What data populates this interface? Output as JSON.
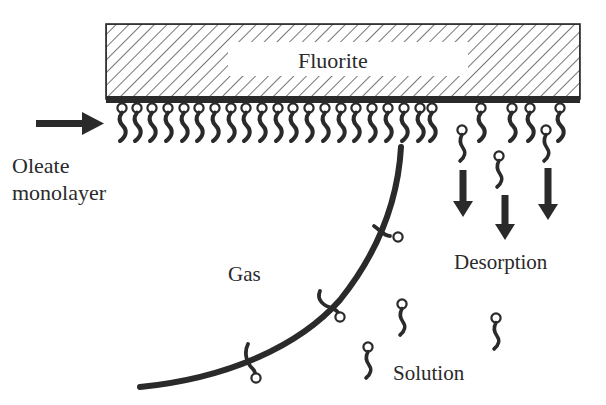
{
  "diagram": {
    "labels": {
      "substrate": "Fluorite",
      "monolayer_line1": "Oleate",
      "monolayer_line2": "monolayer",
      "gas": "Gas",
      "desorption": "Desorption",
      "solution": "Solution"
    },
    "colors": {
      "ink": "#2a2a2a",
      "background": "#ffffff"
    },
    "substrate_box": {
      "x": 106,
      "y": 24,
      "width": 474,
      "height": 73
    },
    "label_window": {
      "x": 228,
      "y": 42,
      "width": 240,
      "height": 34
    },
    "monolayer_heads_x": [
      122,
      137,
      152,
      168,
      184,
      199,
      215,
      231,
      246,
      262,
      278,
      293,
      309,
      325,
      341,
      356,
      372,
      388,
      404,
      420,
      432
    ],
    "sparse_adsorbed_heads_x": [
      481,
      512,
      530,
      560
    ],
    "desorbing_molecules": [
      {
        "x": 462,
        "y": 130
      },
      {
        "x": 499,
        "y": 156
      },
      {
        "x": 546,
        "y": 130
      }
    ],
    "desorption_arrows": [
      {
        "x": 463,
        "top": 170,
        "bottom": 217
      },
      {
        "x": 505,
        "top": 195,
        "bottom": 240
      },
      {
        "x": 548,
        "top": 168,
        "bottom": 220
      }
    ],
    "bubble_attached_heads": [
      {
        "x": 398,
        "y": 237
      },
      {
        "x": 340,
        "y": 317
      },
      {
        "x": 256,
        "y": 378
      }
    ],
    "solution_molecules": [
      {
        "x": 402,
        "y": 304
      },
      {
        "x": 368,
        "y": 347
      },
      {
        "x": 496,
        "y": 318
      }
    ]
  }
}
